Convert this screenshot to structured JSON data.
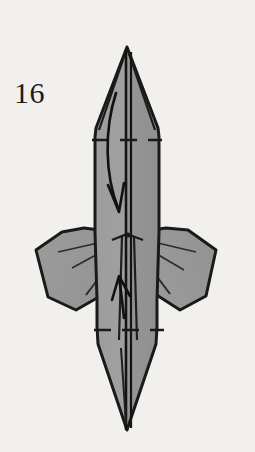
{
  "page": {
    "background_color": "#f2f0ec",
    "width": 255,
    "height": 452
  },
  "step": {
    "number_label": "16",
    "caption": ""
  },
  "figure": {
    "paper_fill_color": "#9a9a9a",
    "paper_fill_shadow_color": "#8d8d8d",
    "outline_color": "#1a1a1a",
    "crease_line_color": "#2a2a2a",
    "fold_dash_color": "#1a1a1a",
    "arrow_color": "#111111",
    "parts": [
      {
        "name": "top-point",
        "label": "Top point"
      },
      {
        "name": "upper-body",
        "label": "Upper body panel"
      },
      {
        "name": "left-wing",
        "label": "Left wing flap"
      },
      {
        "name": "right-wing",
        "label": "Right wing flap"
      },
      {
        "name": "lower-body",
        "label": "Lower body panel"
      },
      {
        "name": "bottom-point",
        "label": "Bottom point"
      }
    ],
    "fold_lines": [
      {
        "name": "upper-valley-fold",
        "orientation": "horizontal",
        "y": 140
      },
      {
        "name": "lower-valley-fold",
        "orientation": "horizontal",
        "y": 330
      }
    ],
    "arrows": [
      {
        "name": "fold-down-arrow",
        "direction": "down",
        "style": "curved"
      },
      {
        "name": "fold-up-arrow",
        "direction": "up",
        "style": "straight"
      }
    ]
  }
}
